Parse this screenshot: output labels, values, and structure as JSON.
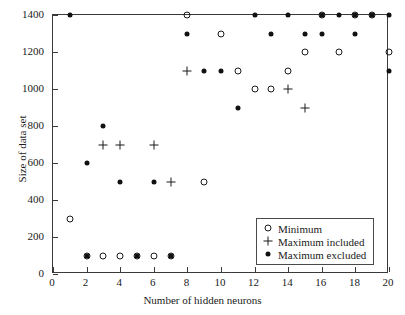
{
  "chart_data": {
    "type": "scatter",
    "title": "",
    "xlabel": "Number of hidden neurons",
    "ylabel": "Size of data set",
    "xlim": [
      0,
      20
    ],
    "ylim": [
      0,
      1400
    ],
    "xticks": [
      0,
      2,
      4,
      6,
      8,
      10,
      12,
      14,
      16,
      18,
      20
    ],
    "yticks": [
      0,
      200,
      400,
      600,
      800,
      1000,
      1200,
      1400
    ],
    "xtick_labels": [
      "0",
      "2",
      "4",
      "6",
      "8",
      "10",
      "12",
      "14",
      "16",
      "18",
      "20"
    ],
    "ytick_labels": [
      "0",
      "200",
      "400",
      "600",
      "800",
      "1000",
      "1200",
      "1400"
    ],
    "grid": false,
    "legend_position": "lower right",
    "series": [
      {
        "name": "Minimum",
        "marker": "open-circle",
        "color": "#1a1a1a",
        "points": [
          [
            1,
            300
          ],
          [
            2,
            100
          ],
          [
            3,
            100
          ],
          [
            4,
            100
          ],
          [
            5,
            100
          ],
          [
            6,
            100
          ],
          [
            7,
            100
          ],
          [
            8,
            1400
          ],
          [
            9,
            500
          ],
          [
            10,
            1300
          ],
          [
            11,
            1100
          ],
          [
            12,
            1000
          ],
          [
            13,
            1000
          ],
          [
            14,
            1100
          ],
          [
            15,
            1200
          ],
          [
            16,
            1400
          ],
          [
            17,
            1200
          ],
          [
            18,
            1400
          ],
          [
            19,
            1400
          ],
          [
            20,
            1200
          ]
        ]
      },
      {
        "name": "Maximum included",
        "marker": "plus",
        "color": "#1a1a1a",
        "points": [
          [
            3,
            700
          ],
          [
            4,
            700
          ],
          [
            6,
            700
          ],
          [
            7,
            500
          ],
          [
            8,
            1100
          ],
          [
            14,
            1000
          ],
          [
            15,
            900
          ]
        ]
      },
      {
        "name": "Maximum excluded",
        "marker": "filled-dot",
        "color": "#111111",
        "points": [
          [
            1,
            1400
          ],
          [
            2,
            600
          ],
          [
            2,
            100
          ],
          [
            3,
            800
          ],
          [
            4,
            500
          ],
          [
            5,
            100
          ],
          [
            6,
            500
          ],
          [
            7,
            100
          ],
          [
            8,
            1300
          ],
          [
            9,
            1100
          ],
          [
            10,
            1100
          ],
          [
            11,
            900
          ],
          [
            12,
            1400
          ],
          [
            13,
            1300
          ],
          [
            14,
            1400
          ],
          [
            15,
            1300
          ],
          [
            16,
            1300
          ],
          [
            16,
            1400
          ],
          [
            17,
            1400
          ],
          [
            18,
            1300
          ],
          [
            18,
            1400
          ],
          [
            19,
            1400
          ],
          [
            20,
            1400
          ],
          [
            20,
            1100
          ]
        ]
      }
    ],
    "legend": [
      {
        "label": "Minimum",
        "marker": "open-circle"
      },
      {
        "label": "Maximum included",
        "marker": "plus"
      },
      {
        "label": "Maximum excluded",
        "marker": "filled-dot"
      }
    ]
  }
}
